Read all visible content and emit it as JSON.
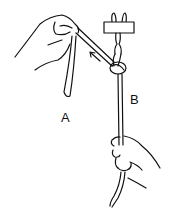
{
  "illustration": {
    "subject": "knot-tying diagram",
    "labels": {
      "a": "A",
      "b": "B"
    },
    "colors": {
      "ink": "#111111",
      "background": "#ffffff"
    }
  }
}
